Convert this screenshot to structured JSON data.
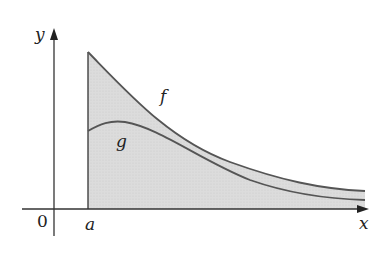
{
  "figure": {
    "labels": {
      "y_axis": "y",
      "x_axis": "x",
      "origin": "0",
      "a": "a",
      "f": "f",
      "g": "g"
    },
    "colors": {
      "fill": "#d9d9d9",
      "curve": "#555555",
      "axis": "#333333"
    },
    "curves": {
      "f": "decreasing curve starting high at x=a, asymptotically approaching the x-axis",
      "g": "curve below f starting at x=a, rising slightly to a small peak then decreasing toward x-axis"
    },
    "shaded_region": "region under f from x=a rightward (shaded gray)"
  }
}
